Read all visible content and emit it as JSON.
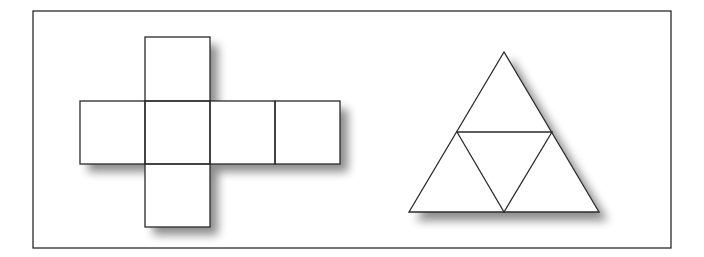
{
  "figure": {
    "width": 704,
    "height": 257,
    "background": "#ffffff",
    "stroke_color": "#2a2a2a",
    "fill_color": "#ffffff",
    "shadow_color": "#9a9a9a",
    "frame": {
      "x": 33,
      "y": 11,
      "width": 638,
      "height": 237
    },
    "cube_net": {
      "label": "cube net",
      "square_size": 65,
      "squares": [
        {
          "name": "top",
          "x": 145,
          "y": 37,
          "w": 65,
          "h": 64
        },
        {
          "name": "left",
          "x": 80,
          "y": 101,
          "w": 65,
          "h": 63
        },
        {
          "name": "center",
          "x": 145,
          "y": 101,
          "w": 65,
          "h": 63
        },
        {
          "name": "right",
          "x": 210,
          "y": 101,
          "w": 65,
          "h": 63
        },
        {
          "name": "far-right",
          "x": 275,
          "y": 101,
          "w": 65,
          "h": 63
        },
        {
          "name": "bottom",
          "x": 145,
          "y": 164,
          "w": 65,
          "h": 63
        }
      ]
    },
    "tetrahedron_net": {
      "label": "tetrahedron net",
      "outer_triangle": {
        "apex": [
          504,
          52
        ],
        "base_left": [
          409,
          212
        ],
        "base_right": [
          599,
          212
        ]
      },
      "inner_triangle": {
        "left_mid": [
          457,
          132
        ],
        "right_mid": [
          552,
          132
        ],
        "bottom_mid": [
          504,
          212
        ]
      }
    }
  }
}
